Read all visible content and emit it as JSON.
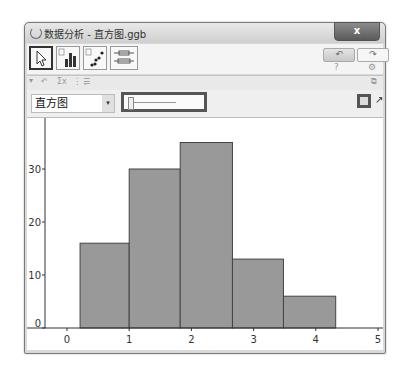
{
  "window": {
    "title": "数据分析 - 直方图.ggb",
    "close_label": "x"
  },
  "toolbar": {
    "tools": [
      {
        "name": "move-tool",
        "icon": "cursor-arrow-icon",
        "selected": true
      },
      {
        "name": "histogram-tool",
        "icon": "bar-chart-icon",
        "selected": false
      },
      {
        "name": "scatter-tool",
        "icon": "scatter-plot-icon",
        "selected": false
      },
      {
        "name": "boxplot-tool",
        "icon": "box-plot-icon",
        "selected": false
      }
    ],
    "undo_label": "↶",
    "redo_label": "↷",
    "help_label": "?",
    "settings_label": "⚙"
  },
  "stylebar": {
    "toggle_label": "▾",
    "items": [
      "↶",
      "Σx",
      "⋮⋮",
      "☰"
    ],
    "collapse_label": "⧉"
  },
  "viewbar": {
    "plot_type": "直方图",
    "dropdown_arrow": "▾",
    "export_label": "▣",
    "popout_label": "↗"
  },
  "chart_data": {
    "type": "bar",
    "title": "",
    "xlabel": "",
    "ylabel": "",
    "bins": [
      {
        "from": 0.21,
        "to": 1.0,
        "value": 16
      },
      {
        "from": 1.0,
        "to": 1.82,
        "value": 30
      },
      {
        "from": 1.82,
        "to": 2.66,
        "value": 35
      },
      {
        "from": 2.66,
        "to": 3.48,
        "value": 13
      },
      {
        "from": 3.48,
        "to": 4.32,
        "value": 6
      }
    ],
    "values": [
      16,
      30,
      35,
      13,
      6
    ],
    "xticks": [
      "0",
      "1",
      "2",
      "3",
      "4",
      "5"
    ],
    "yticks": [
      "0",
      "10",
      "20",
      "30"
    ],
    "xlim": [
      -0.35,
      5.1
    ],
    "ylim": [
      0,
      38
    ],
    "bar_color": "#999999",
    "grid": false
  }
}
